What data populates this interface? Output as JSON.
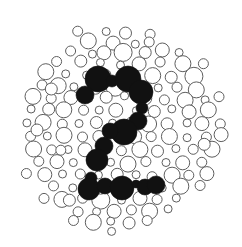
{
  "figure": {
    "kind": "ishihara-plate",
    "hidden_numeral": "2",
    "alt_text": "Monochrome Ishihara-style test plate composed of many circles of varying size; solid black circles form the numeral 2 at the center.",
    "background_color": "#ffffff",
    "outline_color": "#5e5e5e",
    "fill_color": "#111111",
    "plate": {
      "cx": 119,
      "cy": 126,
      "r": 111
    }
  },
  "chart_data": {
    "type": "scatter",
    "xlabel": "",
    "ylabel": "",
    "xlim": [
      0,
      242
    ],
    "ylim": [
      0,
      247
    ],
    "grid": false,
    "legend": "none",
    "annotations": [
      "Hidden numeral: 2"
    ],
    "series": [
      {
        "name": "background-dots",
        "marker": "circle-outline",
        "color": "#5e5e5e",
        "points": [
          [
            95,
            21,
            7
          ],
          [
            116,
            19,
            5
          ],
          [
            140,
            22,
            8
          ],
          [
            158,
            25,
            4
          ],
          [
            77,
            30,
            5
          ],
          [
            106,
            31,
            4
          ],
          [
            126,
            33,
            6
          ],
          [
            150,
            35,
            5
          ],
          [
            170,
            31,
            9
          ],
          [
            61,
            38,
            9
          ],
          [
            88,
            40,
            8
          ],
          [
            113,
            42,
            7
          ],
          [
            135,
            45,
            4
          ],
          [
            184,
            40,
            5
          ],
          [
            200,
            44,
            4
          ],
          [
            47,
            48,
            7
          ],
          [
            70,
            52,
            5
          ],
          [
            92,
            54,
            4
          ],
          [
            104,
            53,
            7
          ],
          [
            124,
            53,
            9
          ],
          [
            146,
            52,
            6
          ],
          [
            163,
            49,
            7
          ],
          [
            178,
            52,
            4
          ],
          [
            196,
            54,
            8
          ],
          [
            214,
            52,
            5
          ],
          [
            36,
            58,
            9
          ],
          [
            57,
            62,
            5
          ],
          [
            80,
            62,
            6
          ],
          [
            100,
            63,
            4
          ],
          [
            121,
            64,
            4
          ],
          [
            140,
            64,
            7
          ],
          [
            160,
            63,
            5
          ],
          [
            182,
            64,
            8
          ],
          [
            203,
            63,
            5
          ],
          [
            219,
            61,
            4
          ],
          [
            28,
            71,
            5
          ],
          [
            46,
            72,
            8
          ],
          [
            66,
            74,
            4
          ],
          [
            86,
            76,
            4
          ],
          [
            107,
            74,
            5
          ],
          [
            132,
            75,
            4
          ],
          [
            152,
            76,
            8
          ],
          [
            172,
            77,
            6
          ],
          [
            193,
            76,
            9
          ],
          [
            212,
            74,
            7
          ],
          [
            225,
            72,
            4
          ],
          [
            22,
            83,
            7
          ],
          [
            41,
            86,
            5
          ],
          [
            58,
            85,
            8
          ],
          [
            75,
            86,
            4
          ],
          [
            96,
            87,
            6
          ],
          [
            116,
            86,
            9
          ],
          [
            137,
            86,
            5
          ],
          [
            157,
            88,
            4
          ],
          [
            178,
            88,
            5
          ],
          [
            197,
            89,
            8
          ],
          [
            216,
            86,
            6
          ],
          [
            229,
            84,
            4
          ],
          [
            17,
            96,
            5
          ],
          [
            33,
            97,
            8
          ],
          [
            52,
            98,
            5
          ],
          [
            70,
            97,
            7
          ],
          [
            89,
            99,
            4
          ],
          [
            107,
            98,
            6
          ],
          [
            124,
            97,
            4
          ],
          [
            144,
            98,
            7
          ],
          [
            165,
            99,
            5
          ],
          [
            185,
            100,
            8
          ],
          [
            204,
            99,
            4
          ],
          [
            220,
            97,
            5
          ],
          [
            232,
            96,
            4
          ],
          [
            14,
            109,
            8
          ],
          [
            32,
            110,
            4
          ],
          [
            48,
            110,
            6
          ],
          [
            65,
            111,
            8
          ],
          [
            84,
            111,
            5
          ],
          [
            99,
            110,
            4
          ],
          [
            116,
            110,
            7
          ],
          [
            136,
            111,
            4
          ],
          [
            155,
            111,
            6
          ],
          [
            173,
            110,
            4
          ],
          [
            191,
            111,
            5
          ],
          [
            209,
            110,
            8
          ],
          [
            225,
            109,
            5
          ],
          [
            235,
            108,
            4
          ],
          [
            12,
            122,
            5
          ],
          [
            28,
            123,
            4
          ],
          [
            44,
            123,
            8
          ],
          [
            62,
            124,
            5
          ],
          [
            80,
            124,
            4
          ],
          [
            97,
            123,
            6
          ],
          [
            113,
            124,
            4
          ],
          [
            131,
            123,
            5
          ],
          [
            149,
            124,
            8
          ],
          [
            168,
            123,
            6
          ],
          [
            186,
            124,
            4
          ],
          [
            203,
            123,
            7
          ],
          [
            221,
            123,
            5
          ],
          [
            234,
            121,
            4
          ],
          [
            13,
            135,
            7
          ],
          [
            31,
            136,
            5
          ],
          [
            48,
            136,
            4
          ],
          [
            64,
            136,
            8
          ],
          [
            83,
            137,
            5
          ],
          [
            100,
            136,
            6
          ],
          [
            118,
            137,
            4
          ],
          [
            134,
            136,
            7
          ],
          [
            152,
            137,
            5
          ],
          [
            170,
            136,
            8
          ],
          [
            188,
            137,
            4
          ],
          [
            206,
            136,
            5
          ],
          [
            222,
            135,
            7
          ],
          [
            234,
            134,
            4
          ],
          [
            16,
            148,
            5
          ],
          [
            33,
            149,
            8
          ],
          [
            51,
            149,
            5
          ],
          [
            68,
            149,
            4
          ],
          [
            86,
            150,
            7
          ],
          [
            103,
            149,
            4
          ],
          [
            121,
            150,
            5
          ],
          [
            139,
            149,
            8
          ],
          [
            157,
            150,
            6
          ],
          [
            175,
            149,
            4
          ],
          [
            193,
            150,
            5
          ],
          [
            211,
            149,
            8
          ],
          [
            227,
            147,
            5
          ],
          [
            20,
            161,
            8
          ],
          [
            39,
            162,
            5
          ],
          [
            56,
            162,
            7
          ],
          [
            74,
            162,
            4
          ],
          [
            93,
            163,
            5
          ],
          [
            110,
            162,
            4
          ],
          [
            128,
            163,
            8
          ],
          [
            147,
            162,
            5
          ],
          [
            165,
            163,
            4
          ],
          [
            183,
            162,
            7
          ],
          [
            201,
            162,
            5
          ],
          [
            218,
            160,
            8
          ],
          [
            231,
            158,
            4
          ],
          [
            27,
            174,
            5
          ],
          [
            45,
            175,
            7
          ],
          [
            63,
            175,
            4
          ],
          [
            81,
            175,
            5
          ],
          [
            99,
            176,
            4
          ],
          [
            117,
            175,
            6
          ],
          [
            135,
            175,
            4
          ],
          [
            153,
            176,
            5
          ],
          [
            171,
            175,
            8
          ],
          [
            190,
            175,
            5
          ],
          [
            207,
            174,
            7
          ],
          [
            222,
            172,
            4
          ],
          [
            34,
            186,
            8
          ],
          [
            54,
            187,
            5
          ],
          [
            72,
            187,
            4
          ],
          [
            90,
            188,
            7
          ],
          [
            109,
            187,
            5
          ],
          [
            127,
            188,
            4
          ],
          [
            145,
            187,
            6
          ],
          [
            163,
            188,
            4
          ],
          [
            181,
            187,
            8
          ],
          [
            199,
            186,
            5
          ],
          [
            215,
            185,
            6
          ],
          [
            44,
            198,
            5
          ],
          [
            63,
            199,
            8
          ],
          [
            82,
            199,
            5
          ],
          [
            101,
            200,
            9
          ],
          [
            121,
            200,
            4
          ],
          [
            139,
            199,
            7
          ],
          [
            158,
            200,
            5
          ],
          [
            176,
            199,
            4
          ],
          [
            194,
            198,
            8
          ],
          [
            209,
            196,
            5
          ],
          [
            57,
            210,
            8
          ],
          [
            77,
            211,
            5
          ],
          [
            96,
            211,
            4
          ],
          [
            113,
            212,
            7
          ],
          [
            131,
            211,
            5
          ],
          [
            149,
            211,
            8
          ],
          [
            167,
            210,
            4
          ],
          [
            185,
            209,
            6
          ],
          [
            199,
            207,
            4
          ],
          [
            73,
            221,
            5
          ],
          [
            93,
            222,
            8
          ],
          [
            111,
            222,
            4
          ],
          [
            129,
            222,
            6
          ],
          [
            147,
            221,
            5
          ],
          [
            165,
            220,
            7
          ],
          [
            181,
            217,
            4
          ],
          [
            92,
            231,
            6
          ],
          [
            112,
            232,
            4
          ],
          [
            131,
            231,
            7
          ],
          [
            150,
            229,
            5
          ],
          [
            166,
            226,
            4
          ],
          [
            110,
            239,
            5
          ],
          [
            130,
            238,
            4
          ],
          [
            146,
            236,
            5
          ],
          [
            52,
            88,
            6
          ],
          [
            38,
            130,
            6
          ],
          [
            205,
            145,
            6
          ],
          [
            70,
            200,
            6
          ],
          [
            150,
            43,
            5
          ],
          [
            190,
            113,
            7
          ],
          [
            60,
            150,
            5
          ],
          [
            100,
            190,
            5
          ]
        ]
      },
      {
        "name": "numeral-dots",
        "marker": "circle-filled",
        "color": "#111111",
        "points": [
          [
            98,
            79,
            13
          ],
          [
            112,
            81,
            6
          ],
          [
            128,
            79,
            13
          ],
          [
            85,
            95,
            9
          ],
          [
            141,
            92,
            12
          ],
          [
            142,
            108,
            6
          ],
          [
            138,
            121,
            9
          ],
          [
            124,
            132,
            13
          ],
          [
            110,
            131,
            8
          ],
          [
            104,
            146,
            9
          ],
          [
            97,
            160,
            11
          ],
          [
            91,
            178,
            6
          ],
          [
            89,
            189,
            11
          ],
          [
            105,
            186,
            8
          ],
          [
            122,
            188,
            12
          ],
          [
            136,
            184,
            4
          ],
          [
            145,
            187,
            8
          ],
          [
            156,
            185,
            9
          ]
        ]
      }
    ]
  }
}
